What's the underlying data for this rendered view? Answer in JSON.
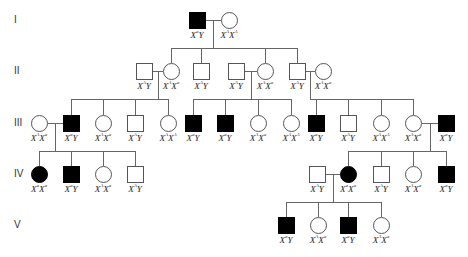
{
  "diagram": {
    "type": "pedigree",
    "symbol_size": 17,
    "colors": {
      "affected": "#000000",
      "unaffected": "#ffffff",
      "line": "#666666"
    },
    "generations": [
      {
        "label": "I",
        "y": 20
      },
      {
        "label": "II",
        "y": 71
      },
      {
        "label": "III",
        "y": 123
      },
      {
        "label": "IV",
        "y": 174
      },
      {
        "label": "V",
        "y": 225
      }
    ],
    "individuals": [
      {
        "id": "I-1",
        "gen": 0,
        "x": 197,
        "sex": "male",
        "affected": true,
        "genotype": [
          "X",
          "a",
          "Y",
          ""
        ]
      },
      {
        "id": "I-2",
        "gen": 0,
        "x": 229,
        "sex": "female",
        "affected": false,
        "genotype": [
          "X",
          "A",
          "X",
          "A"
        ]
      },
      {
        "id": "II-1",
        "gen": 1,
        "x": 144,
        "sex": "male",
        "affected": false,
        "genotype": [
          "X",
          "A",
          "Y",
          ""
        ]
      },
      {
        "id": "II-2",
        "gen": 1,
        "x": 171,
        "sex": "female",
        "affected": false,
        "genotype": [
          "X",
          "A",
          "X",
          "a"
        ]
      },
      {
        "id": "II-3",
        "gen": 1,
        "x": 201,
        "sex": "male",
        "affected": false,
        "genotype": [
          "X",
          "A",
          "Y",
          ""
        ]
      },
      {
        "id": "II-4",
        "gen": 1,
        "x": 236,
        "sex": "male",
        "affected": false,
        "genotype": [
          "X",
          "A",
          "Y",
          ""
        ]
      },
      {
        "id": "II-5",
        "gen": 1,
        "x": 265,
        "sex": "female",
        "affected": false,
        "genotype": [
          "X",
          "A",
          "X",
          "a"
        ]
      },
      {
        "id": "II-6",
        "gen": 1,
        "x": 297,
        "sex": "male",
        "affected": false,
        "genotype": [
          "X",
          "A",
          "Y",
          ""
        ]
      },
      {
        "id": "II-7",
        "gen": 1,
        "x": 323,
        "sex": "female",
        "affected": false,
        "genotype": [
          "X",
          "A",
          "X",
          "a"
        ]
      },
      {
        "id": "III-1",
        "gen": 2,
        "x": 39,
        "sex": "female",
        "affected": false,
        "genotype": [
          "X",
          "A",
          "X",
          "a"
        ]
      },
      {
        "id": "III-2",
        "gen": 2,
        "x": 71,
        "sex": "male",
        "affected": true,
        "genotype": [
          "X",
          "a",
          "Y",
          ""
        ]
      },
      {
        "id": "III-3",
        "gen": 2,
        "x": 103,
        "sex": "female",
        "affected": false,
        "genotype": [
          "X",
          "A",
          "X",
          "a"
        ]
      },
      {
        "id": "III-4",
        "gen": 2,
        "x": 135,
        "sex": "male",
        "affected": false,
        "genotype": [
          "X",
          "A",
          "Y",
          ""
        ]
      },
      {
        "id": "III-5",
        "gen": 2,
        "x": 168,
        "sex": "female",
        "affected": false,
        "genotype": [
          "X",
          "A",
          "X",
          "A"
        ]
      },
      {
        "id": "III-6",
        "gen": 2,
        "x": 193,
        "sex": "male",
        "affected": true,
        "genotype": [
          "X",
          "a",
          "Y",
          ""
        ]
      },
      {
        "id": "III-7",
        "gen": 2,
        "x": 225,
        "sex": "male",
        "affected": true,
        "genotype": [
          "X",
          "a",
          "Y",
          ""
        ]
      },
      {
        "id": "III-8",
        "gen": 2,
        "x": 258,
        "sex": "female",
        "affected": false,
        "genotype": [
          "X",
          "A",
          "X",
          "a"
        ]
      },
      {
        "id": "III-9",
        "gen": 2,
        "x": 291,
        "sex": "female",
        "affected": false,
        "genotype": [
          "X",
          "A",
          "X",
          "A"
        ]
      },
      {
        "id": "III-10",
        "gen": 2,
        "x": 316,
        "sex": "male",
        "affected": true,
        "genotype": [
          "X",
          "a",
          "Y",
          ""
        ]
      },
      {
        "id": "III-11",
        "gen": 2,
        "x": 348,
        "sex": "male",
        "affected": false,
        "genotype": [
          "X",
          "A",
          "Y",
          ""
        ]
      },
      {
        "id": "III-12",
        "gen": 2,
        "x": 381,
        "sex": "female",
        "affected": false,
        "genotype": [
          "X",
          "A",
          "X",
          "A"
        ]
      },
      {
        "id": "III-13",
        "gen": 2,
        "x": 413,
        "sex": "female",
        "affected": false,
        "genotype": [
          "X",
          "A",
          "X",
          "a"
        ]
      },
      {
        "id": "III-14",
        "gen": 2,
        "x": 446,
        "sex": "male",
        "affected": true,
        "genotype": [
          "X",
          "a",
          "Y",
          ""
        ]
      },
      {
        "id": "IV-1",
        "gen": 3,
        "x": 39,
        "sex": "female",
        "affected": true,
        "genotype": [
          "X",
          "a",
          "X",
          "a"
        ]
      },
      {
        "id": "IV-2",
        "gen": 3,
        "x": 71,
        "sex": "male",
        "affected": true,
        "genotype": [
          "X",
          "a",
          "Y",
          ""
        ]
      },
      {
        "id": "IV-3",
        "gen": 3,
        "x": 103,
        "sex": "female",
        "affected": false,
        "genotype": [
          "X",
          "A",
          "X",
          "a"
        ]
      },
      {
        "id": "IV-4",
        "gen": 3,
        "x": 135,
        "sex": "male",
        "affected": false,
        "genotype": [
          "X",
          "A",
          "Y",
          ""
        ]
      },
      {
        "id": "IV-5",
        "gen": 3,
        "x": 317,
        "sex": "male",
        "affected": false,
        "genotype": [
          "X",
          "A",
          "Y",
          ""
        ]
      },
      {
        "id": "IV-6",
        "gen": 3,
        "x": 348,
        "sex": "female",
        "affected": true,
        "genotype": [
          "X",
          "a",
          "X",
          "a"
        ]
      },
      {
        "id": "IV-7",
        "gen": 3,
        "x": 381,
        "sex": "male",
        "affected": false,
        "genotype": [
          "X",
          "A",
          "Y",
          ""
        ]
      },
      {
        "id": "IV-8",
        "gen": 3,
        "x": 413,
        "sex": "female",
        "affected": false,
        "genotype": [
          "X",
          "A",
          "X",
          "a"
        ]
      },
      {
        "id": "IV-9",
        "gen": 3,
        "x": 446,
        "sex": "male",
        "affected": true,
        "genotype": [
          "X",
          "a",
          "Y",
          ""
        ]
      },
      {
        "id": "V-1",
        "gen": 4,
        "x": 286,
        "sex": "male",
        "affected": true,
        "genotype": [
          "X",
          "a",
          "Y",
          ""
        ]
      },
      {
        "id": "V-2",
        "gen": 4,
        "x": 318,
        "sex": "female",
        "affected": false,
        "genotype": [
          "X",
          "A",
          "X",
          "a"
        ]
      },
      {
        "id": "V-3",
        "gen": 4,
        "x": 348,
        "sex": "male",
        "affected": true,
        "genotype": [
          "X",
          "a",
          "Y",
          ""
        ]
      },
      {
        "id": "V-4",
        "gen": 4,
        "x": 381,
        "sex": "female",
        "affected": false,
        "genotype": [
          "X",
          "A",
          "X",
          "a"
        ]
      }
    ],
    "couples": [
      {
        "a": "I-1",
        "b": "I-2",
        "children": [
          "II-2",
          "II-3",
          "II-5",
          "II-6"
        ]
      },
      {
        "a": "II-1",
        "b": "II-2",
        "children": [
          "III-2",
          "III-3",
          "III-4",
          "III-5"
        ]
      },
      {
        "a": "II-4",
        "b": "II-5",
        "children": [
          "III-6",
          "III-7",
          "III-8",
          "III-9"
        ]
      },
      {
        "a": "II-6",
        "b": "II-7",
        "children": [
          "III-10",
          "III-11",
          "III-12",
          "III-13"
        ]
      },
      {
        "a": "III-1",
        "b": "III-2",
        "children": [
          "IV-1",
          "IV-2",
          "IV-3",
          "IV-4"
        ]
      },
      {
        "a": "III-13",
        "b": "III-14",
        "children": [
          "IV-6",
          "IV-7",
          "IV-8",
          "IV-9"
        ]
      },
      {
        "a": "IV-5",
        "b": "IV-6",
        "children": [
          "V-1",
          "V-2",
          "V-3",
          "V-4"
        ]
      }
    ]
  }
}
